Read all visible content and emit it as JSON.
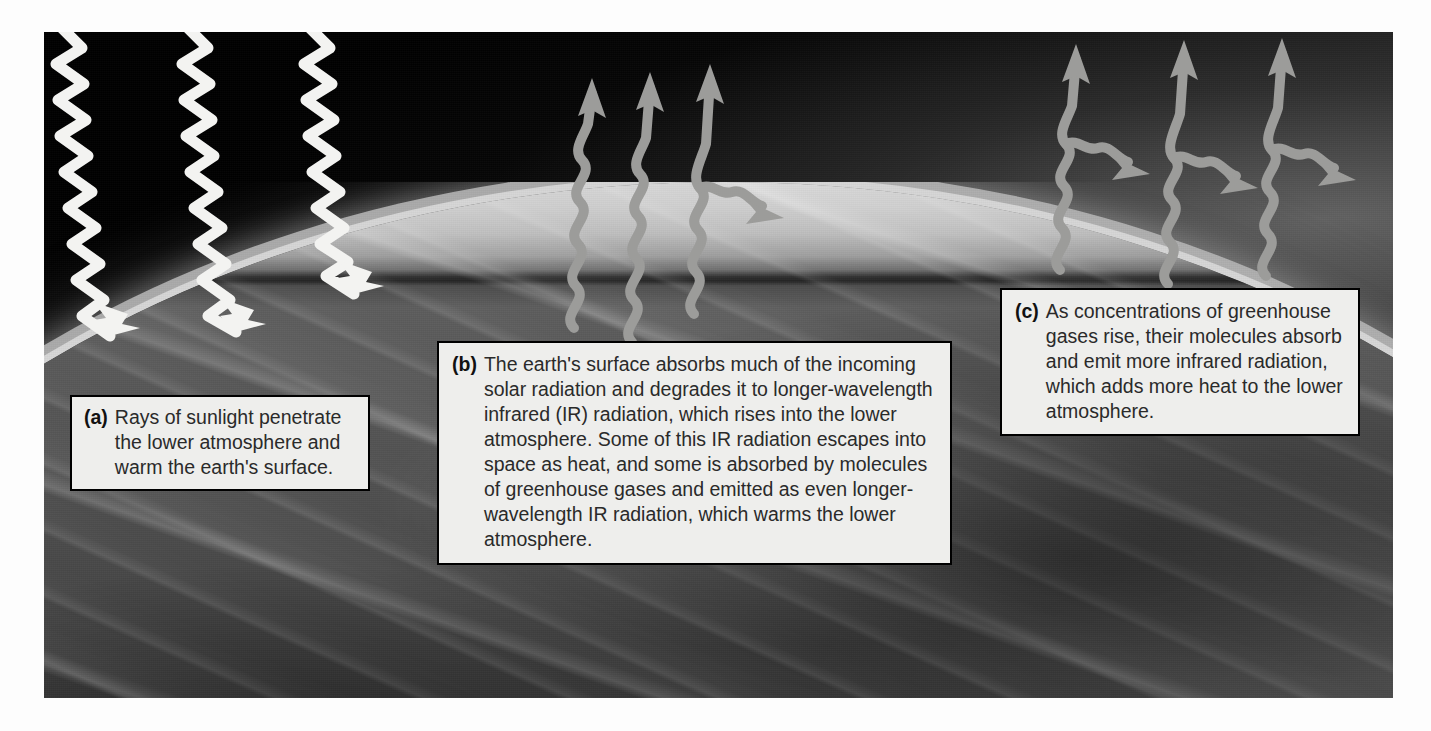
{
  "figure": {
    "kind": "greenhouse-effect-illustration",
    "background_photo": "earth-limb-from-space"
  },
  "captions": [
    {
      "id": "a",
      "tag": "(a)",
      "text": "Rays of sunlight penetrate the lower atmosphere and warm the earth's surface."
    },
    {
      "id": "b",
      "tag": "(b)",
      "text": "The earth's surface absorbs much of the incoming solar radiation and degrades it to longer-wavelength infrared (IR) radiation, which rises into the lower atmosphere. Some of this IR radiation escapes into space as heat, and some is absorbed by molecules of greenhouse gases and emitted as even longer-wavelength IR radiation, which warms the lower atmosphere."
    },
    {
      "id": "c",
      "tag": "(c)",
      "text": "As concentrations of greenhouse gases rise, their molecules absorb and emit more infrared radiation, which adds more heat to the lower atmosphere."
    }
  ],
  "arrows": {
    "incoming_solar": {
      "count": 3,
      "color": "#f2f2f0",
      "direction": "down-right",
      "style": "zigzag-wave-with-arrowhead",
      "name": "incoming-solar-radiation-arrow"
    },
    "escaping_ir": {
      "count": 3,
      "color": "#9b9b99",
      "direction": "up",
      "style": "wavy-with-arrowhead",
      "name": "escaping-infrared-arrow"
    },
    "reemitted_ir": {
      "count": 4,
      "color": "#9b9b99",
      "direction": "down-right",
      "style": "wavy-branch-with-arrowhead",
      "name": "reemitted-infrared-arrow"
    }
  },
  "colors": {
    "caption_background": "#eeeeec",
    "caption_border": "#000000",
    "caption_text": "#2a2a2a",
    "page_background": "#ffffff",
    "space": "#000000",
    "atmosphere_haze": "#d7d7d7"
  }
}
